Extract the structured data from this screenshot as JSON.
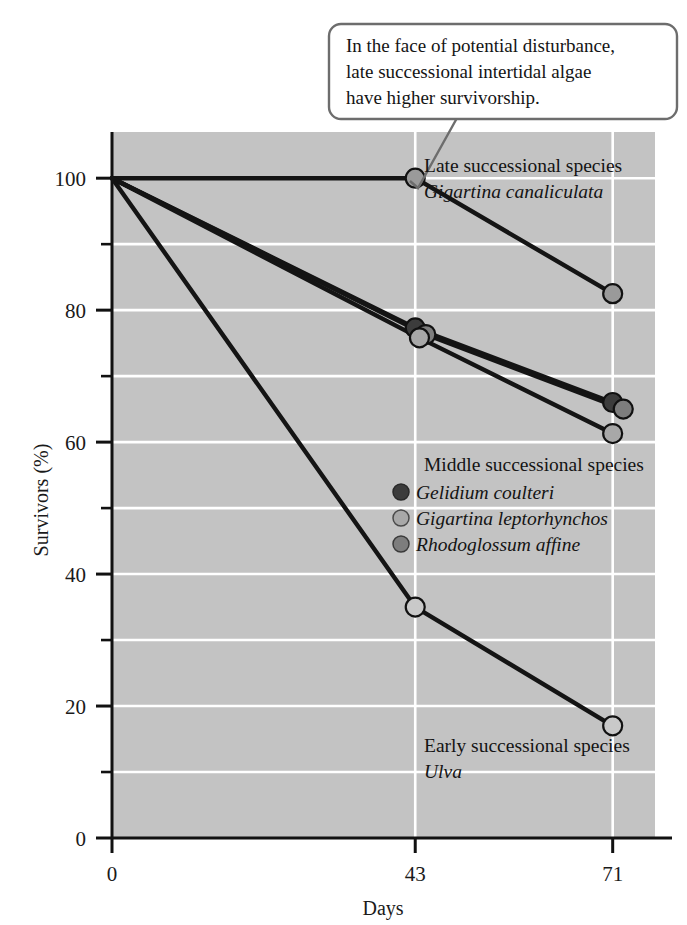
{
  "figure": {
    "background": "#ffffff",
    "plot_background": "#c3c3c3",
    "gridline_color": "#ffffff",
    "axis_color": "#111111"
  },
  "callout": {
    "name": "callout-box",
    "lines": [
      "In the face of potential disturbance,",
      "late successional intertidal algae",
      "have higher survivorship."
    ],
    "border_color": "#6d6d6d",
    "fill": "#ffffff"
  },
  "annotations": {
    "late": {
      "heading": "Late successional species",
      "species": "Gigartina canaliculata"
    },
    "middle": {
      "heading": "Middle successional species",
      "entries": [
        {
          "species": "Gelidium coulteri",
          "marker_color": "#3c3c3c"
        },
        {
          "species": "Gigartina leptorhynchos",
          "marker_color": "#a8a8a8"
        },
        {
          "species": "Rhodoglossum affine",
          "marker_color": "#7d7d7d"
        }
      ]
    },
    "early": {
      "heading": "Early successional species",
      "species": "Ulva"
    }
  },
  "chart_data": {
    "type": "line",
    "title": "",
    "xlabel": "Days",
    "ylabel": "Survivors (%)",
    "xlim": [
      0,
      77
    ],
    "ylim": [
      0,
      107
    ],
    "grid": true,
    "legend_position": "in-plot",
    "x_ticks": [
      0,
      43,
      71
    ],
    "x_tick_labels": [
      "0",
      "43",
      "71"
    ],
    "y_ticks": [
      0,
      20,
      40,
      60,
      80,
      100
    ],
    "y_tick_labels": [
      "0",
      "20",
      "40",
      "60",
      "80",
      "100"
    ],
    "y_minor_ticks": [
      10,
      30,
      50,
      70,
      90
    ],
    "series": [
      {
        "name": "Gigartina canaliculata",
        "group": "Late successional species",
        "marker_color": "#9a9a9a",
        "line_color": "#141414",
        "x": [
          0,
          43,
          71
        ],
        "values": [
          100,
          100,
          82.5
        ]
      },
      {
        "name": "Gelidium coulteri",
        "group": "Middle successional species",
        "marker_color": "#3c3c3c",
        "line_color": "#141414",
        "x": [
          0,
          43,
          71
        ],
        "values": [
          100,
          77.3,
          66
        ]
      },
      {
        "name": "Rhodoglossum affine",
        "group": "Middle successional species",
        "marker_color": "#7d7d7d",
        "line_color": "#141414",
        "x": [
          0,
          44.5,
          72.5
        ],
        "values": [
          100,
          76.3,
          65
        ]
      },
      {
        "name": "Gigartina leptorhynchos",
        "group": "Middle successional species",
        "marker_color": "#a8a8a8",
        "line_color": "#141414",
        "x": [
          0,
          43.6,
          71
        ],
        "values": [
          100,
          75.8,
          61.3
        ]
      },
      {
        "name": "Ulva",
        "group": "Early successional species",
        "marker_color": "#c9c9c9",
        "line_color": "#141414",
        "x": [
          0,
          43,
          71
        ],
        "values": [
          100,
          35,
          17
        ]
      }
    ]
  }
}
